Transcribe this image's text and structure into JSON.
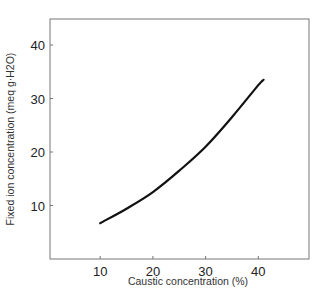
{
  "chart_data": {
    "type": "line",
    "title": "",
    "xlabel": "Caustic concentration (%)",
    "ylabel": "Fixed ion concentration (meq g·H2O)",
    "x_ticks": [
      10,
      20,
      30,
      40
    ],
    "y_ticks": [
      10,
      20,
      30,
      40
    ],
    "xlim": [
      0,
      50
    ],
    "ylim": [
      0,
      45
    ],
    "grid": false,
    "legend": null,
    "series": [
      {
        "name": "Fixed ion concentration",
        "color": "#111111",
        "x": [
          10,
          15,
          20,
          25,
          30,
          35,
          40,
          41
        ],
        "y": [
          6.7,
          9.4,
          12.5,
          16.5,
          21.0,
          26.5,
          32.5,
          33.5
        ]
      }
    ]
  },
  "labels": {
    "x_axis": "Caustic concentration (%)",
    "y_axis": "Fixed ion concentration (meq g·H2O)"
  }
}
